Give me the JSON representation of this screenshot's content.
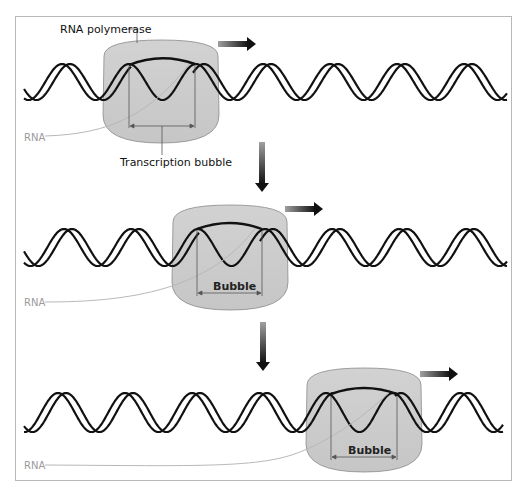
{
  "labels": {
    "polymerase": "RNA polymerase",
    "rna": "RNA",
    "transcription_bubble": "Transcription bubble",
    "bubble": "Bubble"
  },
  "stages": [
    {
      "id": 1,
      "polymerase_label": "RNA polymerase",
      "rna_label": "RNA",
      "bubble_label": "Transcription bubble",
      "direction": "right"
    },
    {
      "id": 2,
      "rna_label": "RNA",
      "bubble_label": "Bubble",
      "direction": "right"
    },
    {
      "id": 3,
      "rna_label": "RNA",
      "bubble_label": "Bubble",
      "direction": "right"
    }
  ],
  "colors": {
    "polymerase_fill": "#c9c9c9",
    "polymerase_stroke": "#8a8a8a",
    "dna_strand": "#111111",
    "rna_line": "#b5b5b5",
    "rna_label": "#9a9a9a",
    "arrow_dark": "#1a1a1a",
    "arrow_light": "#9a9a9a",
    "frame": "#b8b8b8"
  }
}
